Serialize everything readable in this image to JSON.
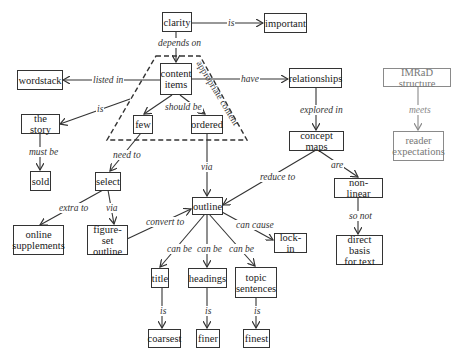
{
  "diagram": {
    "type": "concept-map",
    "group_label": "appropriate content",
    "nodes": {
      "clarity": "clarity",
      "important": "important",
      "wordstack": "wordstack",
      "content_items": "content\nitems",
      "relationships": "relationships",
      "imrad": "IMRaD structure",
      "the_story": "the story",
      "few": "few",
      "ordered": "ordered",
      "concept_maps": "concept maps",
      "reader_expectations": "reader\nexpectations",
      "sold": "sold",
      "select": "select",
      "non_linear": "non-linear",
      "outline": "outline",
      "online_supplements": "online\nsupplements",
      "figure_set_outline": "figure-set\noutline",
      "lock_in": "lock-in",
      "direct_basis": "direct basis\nfor text",
      "title": "title",
      "headings": "headings",
      "topic_sentences": "topic\nsentences",
      "coarsest": "coarsest",
      "finer": "finer",
      "finest": "finest"
    },
    "links": {
      "clarity_important": "is",
      "clarity_content": "depends on",
      "content_wordstack": "listed in",
      "content_relationships": "have",
      "content_story": "is",
      "content_should": "should be",
      "story_sold": "must be",
      "few_select": "need to",
      "ordered_outline": "via",
      "relationships_concept": "explored in",
      "concept_outline": "reduce to",
      "concept_nonlinear": "are",
      "nonlinear_direct": "so not",
      "select_online": "extra to",
      "select_figure": "via",
      "figure_outline": "convert to",
      "outline_lockin": "can cause",
      "outline_title": "can be",
      "outline_headings": "can be",
      "outline_topic": "can be",
      "title_coarsest": "is",
      "headings_finer": "is",
      "topic_finest": "is",
      "imrad_reader": "meets"
    },
    "colors": {
      "primary": "#333333",
      "secondary": "#8a8a8a"
    }
  }
}
